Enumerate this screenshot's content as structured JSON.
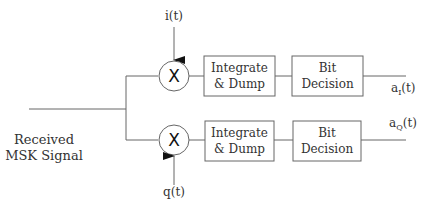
{
  "diagram": {
    "input_label": {
      "line1": "Received",
      "line2": "MSK Signal"
    },
    "branches": {
      "in_phase": {
        "reference_signal": "i(t)",
        "multiplier_symbol": "X",
        "integrator": {
          "line1": "Integrate",
          "line2": "& Dump"
        },
        "decision": {
          "line1": "Bit",
          "line2": "Decision"
        },
        "output": {
          "base": "a",
          "subscript": "I",
          "suffix": "(t)"
        }
      },
      "quadrature": {
        "reference_signal": "q(t)",
        "multiplier_symbol": "X",
        "integrator": {
          "line1": "Integrate",
          "line2": "& Dump"
        },
        "decision": {
          "line1": "Bit",
          "line2": "Decision"
        },
        "output": {
          "base": "a",
          "subscript": "Q",
          "suffix": "(t)"
        }
      }
    },
    "colors": {
      "line": "#666666",
      "text": "#333333",
      "background": "#ffffff"
    }
  }
}
